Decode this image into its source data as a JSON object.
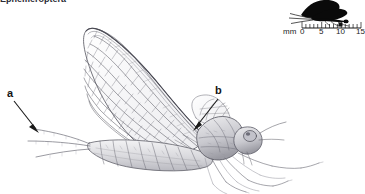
{
  "figure": {
    "title_partial": "Ephemeroptera",
    "background_color": "#ffffff",
    "ink_color": "#54545c"
  },
  "labels": [
    {
      "id": "a",
      "text": "a",
      "points_to": "cerci-tail-filaments"
    },
    {
      "id": "b",
      "text": "b",
      "points_to": "thorax-wing-base"
    }
  ],
  "scale_bar": {
    "unit": "mm",
    "ticks": [
      "0",
      "5",
      "10",
      "15"
    ],
    "minor_tick_interval": 1,
    "silhouette": "mayfly-silhouette"
  }
}
